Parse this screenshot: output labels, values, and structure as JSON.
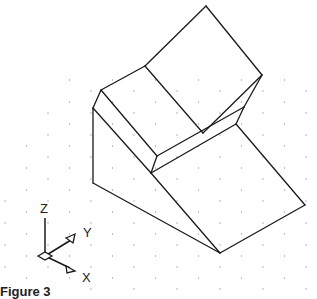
{
  "figure": {
    "background": "#ffffff",
    "line_color": "#1a1a1a",
    "grid_dot_color": "#9a9a9a",
    "caption": "Figure 3"
  },
  "ucs_icon": {
    "z_label": "Z",
    "y_label": "Y",
    "x_label": "X"
  },
  "vertices": {
    "T": [
      206,
      6
    ],
    "R": [
      262,
      75
    ],
    "A": [
      145,
      66
    ],
    "B": [
      101,
      90
    ],
    "C": [
      93,
      108
    ],
    "D": [
      93,
      183
    ],
    "E": [
      220,
      253
    ],
    "F": [
      305,
      205
    ],
    "P1": [
      203,
      133
    ],
    "P2": [
      244,
      107
    ],
    "P3": [
      236,
      124
    ],
    "Q1": [
      157,
      156
    ],
    "Q2": [
      151,
      173
    ]
  }
}
